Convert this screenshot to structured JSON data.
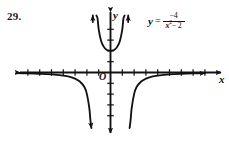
{
  "problem": {
    "number": "29."
  },
  "equation": {
    "variable": "y",
    "equals": "=",
    "numerator": "−4",
    "denominator_base": "x",
    "denominator_exponent": "2",
    "denominator_rest": "− 2",
    "full_text": "y = -4/(x^2 - 2)"
  },
  "axes": {
    "x_label": "x",
    "y_label": "y",
    "origin_label": "O",
    "stroke_color": "#121212"
  },
  "chart_data": {
    "type": "line",
    "title": "",
    "subtitle": "",
    "xlabel": "x",
    "ylabel": "y",
    "function": "y = -4 / (x^2 - 2)",
    "grid": false,
    "legend": false,
    "xlim": [
      -8.2,
      8.2
    ],
    "ylim": [
      -5.6,
      5.6
    ],
    "x_tick_count_left": 7,
    "x_tick_count_right": 7,
    "y_tick_count_above": 4,
    "y_tick_count_below": 4,
    "tick_spacing_units": 1,
    "vertical_asymptotes": [
      -1.414,
      1.414
    ],
    "horizontal_asymptote": 0,
    "y_intercept": 2,
    "branches": [
      {
        "name": "left-branch",
        "domain": "x < -1.414",
        "description": "approaches y=0 from below as x decreases, plunges to -infinity as x approaches -sqrt(2) from the left",
        "points": [
          [
            -8.0,
            -0.065
          ],
          [
            -7.0,
            -0.085
          ],
          [
            -6.0,
            -0.118
          ],
          [
            -5.0,
            -0.174
          ],
          [
            -4.0,
            -0.286
          ],
          [
            -3.5,
            -0.381
          ],
          [
            -3.0,
            -0.571
          ],
          [
            -2.6,
            -0.833
          ],
          [
            -2.2,
            -1.361
          ],
          [
            -2.0,
            -2.0
          ],
          [
            -1.8,
            -3.25
          ],
          [
            -1.7,
            -4.44
          ],
          [
            -1.62,
            -6.1
          ]
        ]
      },
      {
        "name": "middle-branch",
        "domain": "-1.414 < x < 1.414",
        "description": "U-shaped branch opening upward with vertex at (0, 2), rising to +infinity at both asymptotes",
        "points": [
          [
            -1.3,
            12.9
          ],
          [
            -1.2,
            7.14
          ],
          [
            -1.1,
            5.03
          ],
          [
            -1.0,
            4.0
          ],
          [
            -0.8,
            2.94
          ],
          [
            -0.6,
            2.44
          ],
          [
            -0.4,
            2.17
          ],
          [
            -0.2,
            2.04
          ],
          [
            0.0,
            2.0
          ],
          [
            0.2,
            2.04
          ],
          [
            0.4,
            2.17
          ],
          [
            0.6,
            2.44
          ],
          [
            0.8,
            2.94
          ],
          [
            1.0,
            4.0
          ],
          [
            1.1,
            5.03
          ],
          [
            1.2,
            7.14
          ],
          [
            1.3,
            12.9
          ]
        ]
      },
      {
        "name": "right-branch",
        "domain": "x > 1.414",
        "description": "plunges from -infinity at x approaching sqrt(2) from the right, approaches y=0 from below as x increases",
        "points": [
          [
            1.62,
            -6.1
          ],
          [
            1.7,
            -4.44
          ],
          [
            1.8,
            -3.25
          ],
          [
            2.0,
            -2.0
          ],
          [
            2.2,
            -1.361
          ],
          [
            2.6,
            -0.833
          ],
          [
            3.0,
            -0.571
          ],
          [
            3.5,
            -0.381
          ],
          [
            4.0,
            -0.286
          ],
          [
            5.0,
            -0.174
          ],
          [
            6.0,
            -0.118
          ],
          [
            7.0,
            -0.085
          ],
          [
            8.0,
            -0.065
          ]
        ]
      }
    ]
  }
}
